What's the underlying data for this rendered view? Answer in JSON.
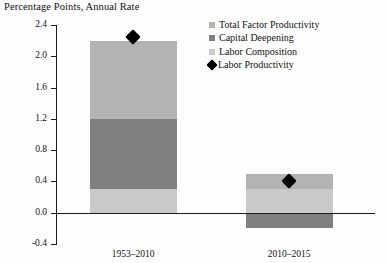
{
  "chart_data": {
    "type": "bar",
    "title": "Percentage Points, Annual Rate",
    "xlabel": "",
    "ylabel": "",
    "ylim": [
      -0.4,
      2.4
    ],
    "ytick_step": 0.4,
    "yticks": [
      "2.4",
      "2.0",
      "1.6",
      "1.2",
      "0.8",
      "0.4",
      "0.0",
      "-0.4"
    ],
    "ytick_values": [
      2.4,
      2.0,
      1.6,
      1.2,
      0.8,
      0.4,
      0.0,
      -0.4
    ],
    "grid": false,
    "stacked": true,
    "legend_position": "top-right",
    "categories": [
      "1953–2010",
      "2010–2015"
    ],
    "series": [
      {
        "name": "Total Factor Productivity",
        "color": "#b3b3b3",
        "values": [
          1.0,
          0.2
        ]
      },
      {
        "name": "Capital Deepening",
        "color": "#808080",
        "values": [
          0.9,
          -0.2
        ]
      },
      {
        "name": "Labor Composition",
        "color": "#c9c9c9",
        "values": [
          0.3,
          0.3
        ]
      }
    ],
    "markers": {
      "name": "Labor Productivity",
      "color": "#000000",
      "shape": "diamond",
      "values": [
        2.25,
        0.4
      ]
    },
    "stack_tops": [
      2.2,
      0.5
    ],
    "stack_bottoms": [
      0.0,
      -0.2
    ]
  },
  "legend": {
    "items": [
      {
        "label": "Total Factor Productivity",
        "marker": "square-swatch",
        "color": "#b3b3b3"
      },
      {
        "label": "Capital Deepening",
        "marker": "square-swatch",
        "color": "#808080"
      },
      {
        "label": "Labor Composition",
        "marker": "square-swatch",
        "color": "#c9c9c9"
      },
      {
        "label": "Labor Productivity",
        "marker": "diamond-marker",
        "color": "#000000"
      }
    ]
  }
}
